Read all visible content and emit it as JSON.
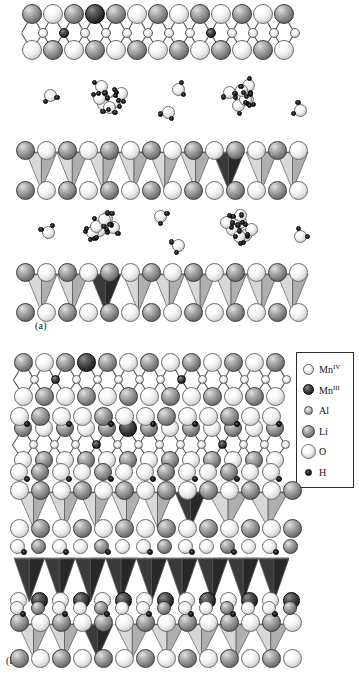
{
  "figure": {
    "background_color": "#ffffff",
    "width": 359,
    "height": 684
  },
  "panels": [
    {
      "id": "a",
      "label": "(a)",
      "label_x": 35,
      "label_y": 326,
      "description": "Hydrated layered structure with two interlayer water regions separating oxide slabs"
    },
    {
      "id": "b",
      "label": "(b)",
      "label_x": 6,
      "label_y": 661,
      "description": "Dehydrated / collapsed layered structure with dense stacked slabs including a dark Mn(III) slab"
    }
  ],
  "legend": {
    "box": {
      "x": 296,
      "y": 352,
      "width": 58,
      "height": 136
    },
    "border_color": "#2b2b2b",
    "items": [
      {
        "species": "Mn",
        "label": "Mn",
        "oxidation": "IV",
        "class": "a-MnIV",
        "size": 11,
        "color": "#ffffff",
        "icon": "sphere-icon"
      },
      {
        "species": "Mn",
        "label": "Mn",
        "oxidation": "III",
        "class": "a-MnIII",
        "size": 11,
        "color": "#1b1b1b",
        "icon": "sphere-icon"
      },
      {
        "species": "Al",
        "label": "Al",
        "oxidation": "",
        "class": "a-Al",
        "size": 9,
        "color": "#a2a2a2",
        "icon": "sphere-icon"
      },
      {
        "species": "Li",
        "label": "Li",
        "oxidation": "",
        "class": "a-Li",
        "size": 13,
        "color": "#8a8a8a",
        "icon": "sphere-icon"
      },
      {
        "species": "O",
        "label": "O",
        "oxidation": "",
        "class": "a-O",
        "size": 15,
        "color": "#ffffff",
        "icon": "sphere-icon"
      },
      {
        "species": "H",
        "label": "H",
        "oxidation": "",
        "class": "a-H",
        "size": 7,
        "color": "#0a0a0a",
        "icon": "sphere-icon"
      }
    ]
  },
  "colors": {
    "slab_light": "#c8c8c8",
    "slab_light_face": "#d8d8d8",
    "slab_light_shade": "#a8a8a8",
    "slab_dark": "#3a3a3a",
    "slab_dark_face": "#4e4e4e",
    "slab_dark_shade": "#262626",
    "slab_black": "#2a2a2a",
    "bond": "#4a4a4a",
    "outline": "#5a5a5a"
  },
  "structure": {
    "panel_a": {
      "layers": [
        {
          "name": "top-oxide-sheet",
          "y": 6,
          "type": "sphere-sheet",
          "rows": 3,
          "columns": 13,
          "top_row_species": [
            "Li",
            "O",
            "Li",
            "MnIII",
            "Li",
            "O",
            "Li",
            "O",
            "Li",
            "O",
            "Li",
            "Li",
            "Li"
          ],
          "mid_row_species": [
            "Al",
            "MnIII",
            "Al",
            "Al",
            "Al",
            "Al",
            "Al",
            "Al",
            "MnIII",
            "Al",
            "Al",
            "Al"
          ],
          "bottom_row_species": [
            "O",
            "Li",
            "O",
            "Li",
            "Li",
            "O",
            "O",
            "Li",
            "O",
            "Li",
            "O",
            "Li",
            "O"
          ]
        },
        {
          "name": "interlayer-water-upper",
          "y": 72,
          "type": "water-region",
          "molecule_count": 18
        },
        {
          "name": "polyhedral-slab-upper",
          "y": 140,
          "type": "polyhedral-slab",
          "polyhedra": 9,
          "dark_polyhedra_index": 7
        },
        {
          "name": "interlayer-water-lower",
          "y": 200,
          "type": "water-region",
          "molecule_count": 18
        },
        {
          "name": "polyhedral-slab-lower",
          "y": 262,
          "type": "polyhedral-slab",
          "polyhedra": 9,
          "dark_polyhedra_index": 1
        }
      ]
    },
    "panel_b": {
      "layers": [
        {
          "name": "upper-oxide-sheet",
          "y": 356,
          "type": "sphere-sheet",
          "rows": 3,
          "columns": 13
        },
        {
          "name": "hydroxyl-sheet-upper",
          "y": 412,
          "type": "sphere-sheet-hydroxyl",
          "rows": 3,
          "columns": 13
        },
        {
          "name": "polyhedral-slab-light-upper",
          "y": 495,
          "type": "polyhedral-slab",
          "polyhedra": 9,
          "dark_polyhedra_index": 7
        },
        {
          "name": "hydroxyl-bridge",
          "y": 545,
          "type": "sphere-sheet-hydroxyl",
          "rows": 1,
          "columns": 13
        },
        {
          "name": "polyhedral-slab-black",
          "y": 556,
          "type": "polyhedral-slab-dark",
          "polyhedra": 9
        },
        {
          "name": "hydroxyl-sheet-lower",
          "y": 600,
          "type": "sphere-sheet-hydroxyl",
          "rows": 1,
          "columns": 13
        },
        {
          "name": "polyhedral-slab-light-lower",
          "y": 614,
          "type": "polyhedral-slab",
          "polyhedra": 9,
          "dark_polyhedra_index": 1
        }
      ]
    }
  }
}
